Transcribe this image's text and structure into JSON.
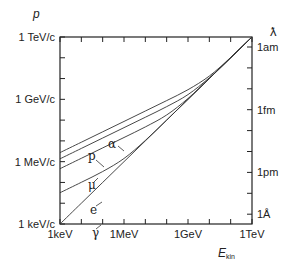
{
  "chart_data": {
    "type": "line",
    "title": "",
    "xlabel": "E_kin",
    "ylabel": "p",
    "y2label": "ƛ",
    "xscale": "log",
    "yscale": "log",
    "x_units": "keV",
    "y_units": "keV/c",
    "xlim_log10": [
      0,
      9
    ],
    "ylim_log10": [
      0,
      9
    ],
    "x_ticks": [
      {
        "log10": 0,
        "label": "1keV"
      },
      {
        "log10": 3,
        "label": "1MeV"
      },
      {
        "log10": 6,
        "label": "1GeV"
      },
      {
        "log10": 9,
        "label": "1TeV"
      }
    ],
    "y_ticks": [
      {
        "log10": 0,
        "label": "1 keV/c"
      },
      {
        "log10": 3,
        "label": "1 MeV/c"
      },
      {
        "log10": 6,
        "label": "1 GeV/c"
      },
      {
        "log10": 9,
        "label": "1 TeV/c"
      }
    ],
    "y2_ticks": [
      {
        "px_y": 47,
        "label": "1am"
      },
      {
        "px_y": 110,
        "label": "1fm"
      },
      {
        "px_y": 172,
        "label": "1pm"
      },
      {
        "px_y": 214,
        "label": "1Å"
      }
    ],
    "grid": false,
    "legend": "inline labels",
    "x_log10": [
      0,
      1,
      2,
      3,
      4,
      5,
      6,
      7,
      8,
      9
    ],
    "series": [
      {
        "name": "α",
        "label_pos": [
          108,
          148
        ],
        "values_log10": [
          3.436,
          3.936,
          4.436,
          4.936,
          5.437,
          5.939,
          6.464,
          7.121,
          8.016,
          9.002
        ]
      },
      {
        "name": "p",
        "label_pos": [
          88,
          160
        ],
        "values_log10": [
          3.137,
          3.637,
          4.137,
          4.637,
          5.138,
          5.648,
          6.229,
          7.037,
          8.004,
          9.0
        ]
      },
      {
        "name": "μ",
        "label_pos": [
          88,
          189
        ],
        "values_log10": [
          2.662,
          3.162,
          3.662,
          4.163,
          4.672,
          5.247,
          6.042,
          7.005,
          8.0,
          9.0
        ]
      },
      {
        "name": "e",
        "label_pos": [
          90,
          214
        ],
        "values_log10": [
          1.505,
          2.007,
          2.525,
          3.153,
          4.021,
          5.002,
          6.0,
          7.0,
          8.0,
          9.0
        ]
      },
      {
        "name": "γ",
        "label_pos": [
          92,
          237
        ],
        "values_log10": [
          0,
          1,
          2,
          3,
          4,
          5,
          6,
          7,
          8,
          9
        ]
      }
    ]
  },
  "labels": {
    "y_axis_title": "p",
    "x_axis_title_main": "E",
    "x_axis_title_sub": "kin",
    "y2_axis_title": "ƛ"
  }
}
